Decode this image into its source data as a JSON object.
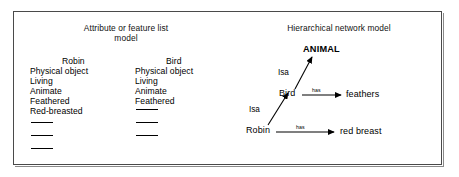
{
  "figure": {
    "left_panel": {
      "title": "Attribute or feature list\nmodel",
      "columns": [
        {
          "head": "Robin",
          "attributes": [
            "Physical object",
            "Living",
            "Animate",
            "Feathered",
            "Red-breasted"
          ],
          "blank_slots": 3
        },
        {
          "head": "Bird",
          "attributes": [
            "Physical object",
            "Living",
            "Animate",
            "Feathered"
          ],
          "blank_slots": 3
        }
      ]
    },
    "right_panel": {
      "title": "Hierarchical network model",
      "nodes": {
        "animal": "ANIMAL",
        "bird": "Bird",
        "robin": "Robin",
        "feathers": "feathers",
        "red_breast": "red breast"
      },
      "edges": {
        "isa_bird_animal": "Isa",
        "isa_robin_bird": "Isa",
        "has_bird_feathers": "has",
        "has_robin_red_breast": "has"
      }
    },
    "colors": {
      "ink": "#000000",
      "border": "#4a4a4a",
      "background": "#ffffff"
    }
  }
}
